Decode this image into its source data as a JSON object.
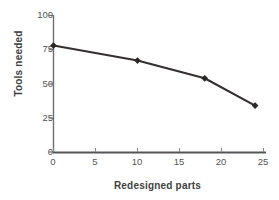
{
  "chart_data": {
    "type": "line",
    "title": "",
    "xlabel": "Redesigned parts",
    "ylabel": "Tools needed",
    "x": [
      0,
      10,
      18,
      24
    ],
    "values": [
      78,
      67,
      54,
      34
    ],
    "series": [
      {
        "name": "Tools needed",
        "x": [
          0,
          10,
          18,
          24
        ],
        "values": [
          78,
          67,
          54,
          34
        ]
      }
    ],
    "xlim": [
      0,
      25
    ],
    "ylim": [
      0,
      100
    ],
    "xticks": [
      0,
      5,
      10,
      15,
      20,
      25
    ],
    "yticks": [
      0,
      25,
      50,
      75,
      100
    ],
    "xtick_labels": [
      "0",
      "5",
      "10",
      "15",
      "20",
      "25"
    ],
    "ytick_labels": [
      "0",
      "25",
      "50",
      "75",
      "100"
    ],
    "grid": false,
    "legend": false,
    "legend_position": "none",
    "marker": "diamond",
    "line_color": "#33302f",
    "marker_color": "#2b2826",
    "axis_color": "#6f6f6f",
    "background": "#ffffff"
  }
}
